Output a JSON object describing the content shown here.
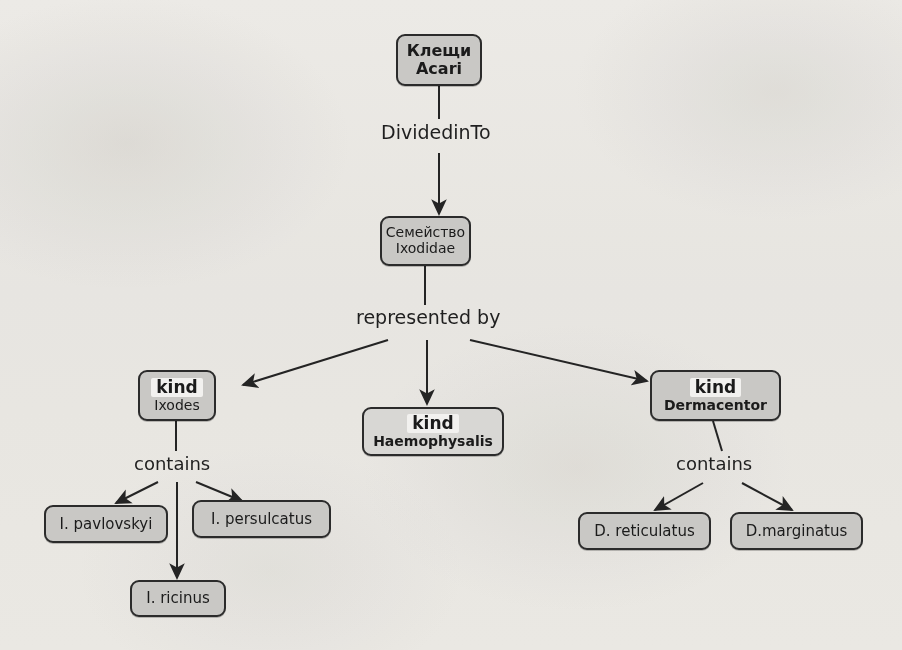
{
  "diagram": {
    "background_color": "#f4f3f1",
    "node_fill": "#c9c8c5",
    "node_fill_light": "#d8d7d4",
    "node_stroke": "#2b2b2b",
    "text_color": "#1b1b1b",
    "nodes": [
      {
        "id": "acari",
        "line1": "Клещи",
        "line2": "Acari"
      },
      {
        "id": "ixodidae",
        "line1": "Семейство",
        "line2": "Ixodidae"
      },
      {
        "id": "ixodes",
        "line1": "kind",
        "line2": "Ixodes"
      },
      {
        "id": "haemophysalis",
        "line1": "kind",
        "line2": "Haemophysalis"
      },
      {
        "id": "dermacentor",
        "line1": "kind",
        "line2": "Dermacentor"
      },
      {
        "id": "pavlovskyi",
        "line1": "I. pavlovskyi",
        "line2": ""
      },
      {
        "id": "persulcatus",
        "line1": "I. persulcatus",
        "line2": ""
      },
      {
        "id": "ricinus",
        "line1": "I. ricinus",
        "line2": ""
      },
      {
        "id": "reticulatus",
        "line1": "D. reticulatus",
        "line2": ""
      },
      {
        "id": "marginatus",
        "line1": "D.marginatus",
        "line2": ""
      }
    ],
    "edge_labels": [
      {
        "id": "divided-in-to",
        "text": "DividedinTo"
      },
      {
        "id": "represented-by",
        "text": "represented by"
      },
      {
        "id": "contains-ixodes",
        "text": "contains"
      },
      {
        "id": "contains-dermacentor",
        "text": "contains"
      }
    ],
    "relations": [
      {
        "from": "acari",
        "label": "DividedinTo",
        "to": "ixodidae"
      },
      {
        "from": "ixodidae",
        "label": "represented by",
        "to": "ixodes"
      },
      {
        "from": "ixodidae",
        "label": "represented by",
        "to": "haemophysalis"
      },
      {
        "from": "ixodidae",
        "label": "represented by",
        "to": "dermacentor"
      },
      {
        "from": "ixodes",
        "label": "contains",
        "to": "pavlovskyi"
      },
      {
        "from": "ixodes",
        "label": "contains",
        "to": "persulcatus"
      },
      {
        "from": "ixodes",
        "label": "contains",
        "to": "ricinus"
      },
      {
        "from": "dermacentor",
        "label": "contains",
        "to": "reticulatus"
      },
      {
        "from": "dermacentor",
        "label": "contains",
        "to": "marginatus"
      }
    ]
  }
}
